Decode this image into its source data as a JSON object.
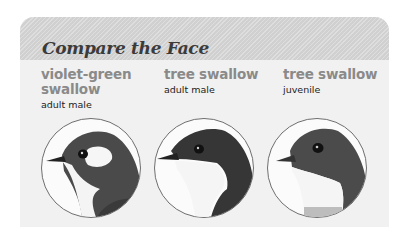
{
  "card": {
    "title": "Compare the Face",
    "header_color": "#d7d7d7",
    "body_color": "#f1f1f1"
  },
  "birds": [
    {
      "name_line1": "violet-green",
      "name_line2": "swallow",
      "subtitle": "adult male",
      "image": "violet-green-swallow-adult-male-head-illustration"
    },
    {
      "name_line1": "tree swallow",
      "name_line2": "",
      "subtitle": "adult male",
      "image": "tree-swallow-adult-male-head-illustration"
    },
    {
      "name_line1": "tree swallow",
      "name_line2": "",
      "subtitle": "juvenile",
      "image": "tree-swallow-juvenile-head-illustration"
    }
  ]
}
